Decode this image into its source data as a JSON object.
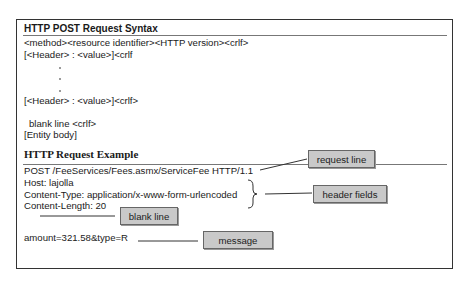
{
  "syntax": {
    "title": "HTTP POST Request Syntax",
    "lines": [
      "<method><resource identifier><HTTP version><crlf>",
      "[<Header> : <value>]<crlf",
      "[<Header> : <value>]<crlf>",
      "blank line <crlf>",
      "[Entity body]"
    ]
  },
  "example": {
    "title": "HTTP Request Example",
    "request_line": "POST /FeeServices/Fees.asmx/ServiceFee HTTP/1.1",
    "headers": [
      "Host: lajolla",
      "Content-Type: application/x-www-form-urlencoded",
      "Content-Length: 20"
    ],
    "body": "amount=321.58&type=R"
  },
  "callouts": {
    "request_line": "request line",
    "header_fields": "header fields",
    "blank_line": "blank line",
    "message": "message"
  },
  "colors": {
    "callout_fill": "#c9c9c9",
    "border": "#333333"
  }
}
